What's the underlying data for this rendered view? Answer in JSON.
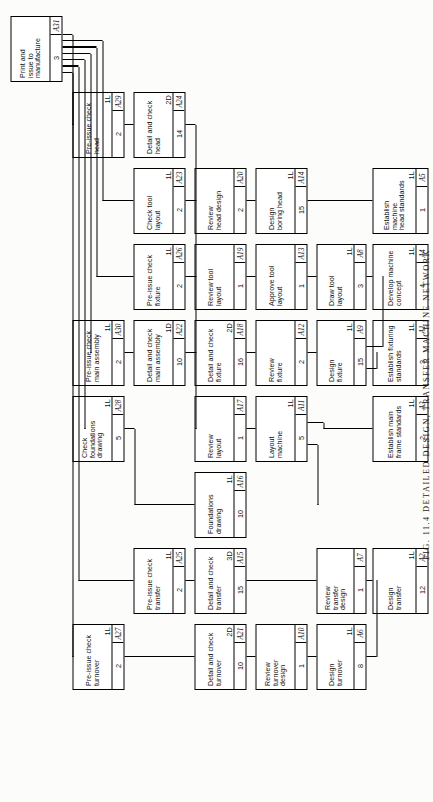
{
  "figure": {
    "caption": "FIG. 11.4  DETAILED DESIGN, TRANSFER MACHINE NETWORK",
    "type": "activity-on-node precedence network",
    "orientation": "rotated 90 degrees counter-clockwise (landscape drawing on portrait page)"
  },
  "legend": {
    "node_fields": [
      "activity description",
      "resource code",
      "duration",
      "activity id"
    ],
    "resource_codes": [
      "1L",
      "1D",
      "2D",
      "3D"
    ]
  },
  "nodes": [
    {
      "id": "A31",
      "title": "Print and\nissue to\nmanufacture",
      "res": "",
      "dur": "3",
      "col": 9,
      "row": 0
    },
    {
      "id": "A27",
      "title": "Pre-issue check\nturnover",
      "res": "1L",
      "dur": "2",
      "col": 1,
      "row": 1
    },
    {
      "id": "A28",
      "title": "Check foundations\ndrawing",
      "res": "1L",
      "dur": "5",
      "col": 4,
      "row": 1
    },
    {
      "id": "A30",
      "title": "Pre-issue check\nmain assembly",
      "res": "1L",
      "dur": "2",
      "col": 5,
      "row": 1
    },
    {
      "id": "A29",
      "title": "Pre-issue check\nhead",
      "res": "1L",
      "dur": "2",
      "col": 8,
      "row": 1
    },
    {
      "id": "A25",
      "title": "Pre-issue check\ntransfer",
      "res": "1L",
      "dur": "2",
      "col": 2,
      "row": 2
    },
    {
      "id": "A22",
      "title": "Detail and check\nmain assembly",
      "res": "1D",
      "dur": "10",
      "col": 5,
      "row": 2
    },
    {
      "id": "A26",
      "title": "Pre-issue check\nfixture",
      "res": "1L",
      "dur": "2",
      "col": 6,
      "row": 2
    },
    {
      "id": "A23",
      "title": "Check tool\nlayout",
      "res": "1L",
      "dur": "2",
      "col": 7,
      "row": 2
    },
    {
      "id": "A24",
      "title": "Detail and check\nhead",
      "res": "2D",
      "dur": "14",
      "col": 8,
      "row": 2
    },
    {
      "id": "A21",
      "title": "Detail and check\nturnover",
      "res": "2D",
      "dur": "10",
      "col": 1,
      "row": 3
    },
    {
      "id": "A15",
      "title": "Detail and check\ntransfer",
      "res": "3D",
      "dur": "15",
      "col": 2,
      "row": 3
    },
    {
      "id": "A16",
      "title": "Foundations\ndrawing",
      "res": "1L",
      "dur": "10",
      "col": 3,
      "row": 3
    },
    {
      "id": "A17",
      "title": "Review\nlayout",
      "res": "",
      "dur": "1",
      "col": 4,
      "row": 3
    },
    {
      "id": "A18",
      "title": "Detail and check\nfixture",
      "res": "2D",
      "dur": "16",
      "col": 5,
      "row": 3
    },
    {
      "id": "A19",
      "title": "Review tool\nlayout",
      "res": "",
      "dur": "1",
      "col": 6,
      "row": 3
    },
    {
      "id": "A20",
      "title": "Review\nhead design",
      "res": "",
      "dur": "2",
      "col": 7,
      "row": 3
    },
    {
      "id": "A10",
      "title": "Review\nturnover\ndesign",
      "res": "",
      "dur": "1",
      "col": 1,
      "row": 4
    },
    {
      "id": "A11",
      "title": "Layout\nmachine",
      "res": "1L",
      "dur": "5",
      "col": 4,
      "row": 4
    },
    {
      "id": "A12",
      "title": "Review\nfixture",
      "res": "",
      "dur": "2",
      "col": 5,
      "row": 4
    },
    {
      "id": "A13",
      "title": "Approve tool\nlayout",
      "res": "",
      "dur": "1",
      "col": 6,
      "row": 4
    },
    {
      "id": "A14",
      "title": "Design\nboring head",
      "res": "1L",
      "dur": "15",
      "col": 7,
      "row": 4
    },
    {
      "id": "A6",
      "title": "Design\nturnover",
      "res": "1L",
      "dur": "8",
      "col": 1,
      "row": 5
    },
    {
      "id": "A7",
      "title": "Review\ntransfer\ndesign",
      "res": "",
      "dur": "1",
      "col": 2,
      "row": 5
    },
    {
      "id": "A9",
      "title": "Design\nfixture",
      "res": "1L",
      "dur": "15",
      "col": 5,
      "row": 5
    },
    {
      "id": "A8",
      "title": "Draw tool\nlayout",
      "res": "1L",
      "dur": "3",
      "col": 6,
      "row": 5
    },
    {
      "id": "A2",
      "title": "Design\ntransfer",
      "res": "1L",
      "dur": "12",
      "col": 2,
      "row": 6
    },
    {
      "id": "A3",
      "title": "Establish main\nframe standards",
      "res": "1L",
      "dur": "2",
      "col": 4,
      "row": 6
    },
    {
      "id": "A1",
      "title": "Establish fixturing\nstandards",
      "res": "1L",
      "dur": "3",
      "col": 5,
      "row": 6
    },
    {
      "id": "A4",
      "title": "Develop machine\nconcept",
      "res": "1L",
      "dur": "4",
      "col": 6,
      "row": 6
    },
    {
      "id": "A5",
      "title": "Establish machine\nhead standards",
      "res": "1L",
      "dur": "1",
      "col": 7,
      "row": 6
    }
  ],
  "edges": [
    {
      "from": "A27",
      "to": "A31"
    },
    {
      "from": "A25",
      "to": "A31"
    },
    {
      "from": "A28",
      "to": "A31"
    },
    {
      "from": "A30",
      "to": "A31"
    },
    {
      "from": "A26",
      "to": "A31"
    },
    {
      "from": "A23",
      "to": "A31"
    },
    {
      "from": "A29",
      "to": "A31"
    },
    {
      "from": "A21",
      "to": "A27"
    },
    {
      "from": "A15",
      "to": "A25"
    },
    {
      "from": "A16",
      "to": "A28"
    },
    {
      "from": "A22",
      "to": "A30"
    },
    {
      "from": "A18",
      "to": "A26"
    },
    {
      "from": "A19",
      "to": "A23"
    },
    {
      "from": "A24",
      "to": "A29"
    },
    {
      "from": "A10",
      "to": "A21"
    },
    {
      "from": "A7",
      "to": "A15"
    },
    {
      "from": "A16",
      "to": "A11"
    },
    {
      "from": "A11",
      "to": "A17"
    },
    {
      "from": "A12",
      "to": "A18"
    },
    {
      "from": "A13",
      "to": "A19"
    },
    {
      "from": "A14",
      "to": "A20"
    },
    {
      "from": "A20",
      "to": "A24"
    },
    {
      "from": "A17",
      "to": "A22"
    },
    {
      "from": "A6",
      "to": "A10"
    },
    {
      "from": "A9",
      "to": "A12"
    },
    {
      "from": "A8",
      "to": "A13"
    },
    {
      "from": "A2",
      "to": "A6"
    },
    {
      "from": "A2",
      "to": "A7"
    },
    {
      "from": "A3",
      "to": "A11"
    },
    {
      "from": "A1",
      "to": "A9"
    },
    {
      "from": "A4",
      "to": "A8"
    },
    {
      "from": "A4",
      "to": "A9"
    },
    {
      "from": "A5",
      "to": "A14"
    }
  ]
}
